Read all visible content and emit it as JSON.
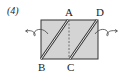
{
  "problem_number": "(4)",
  "labels": {
    "A": "A",
    "B": "B",
    "C": "C",
    "D": "D"
  },
  "colors": {
    "fill": "#d4d4d4",
    "stroke": "#333333",
    "background": "#ffffff"
  },
  "shape": {
    "type": "rectangle",
    "description": "Paper rectangle with two double-line diagonal folds (B–A and C–D), a dashed vertical line from A to C, and curved rotation arrows on both sides"
  }
}
